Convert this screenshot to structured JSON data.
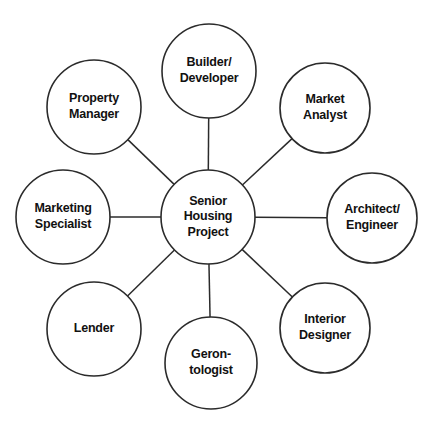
{
  "diagram": {
    "type": "hub-and-spoke",
    "background_color": "#ffffff",
    "stroke_color": "#2b2b2b",
    "text_color": "#111111",
    "hub": {
      "id": "senior-housing-project",
      "label": "Senior Housing Project",
      "lines": [
        "Senior",
        "Housing",
        "Project"
      ],
      "cx": 208,
      "cy": 217,
      "r": 47
    },
    "satellites": [
      {
        "id": "builder-developer",
        "label": "Builder/Developer",
        "lines": [
          "Builder/",
          "Developer"
        ],
        "cx": 209,
        "cy": 71,
        "r": 47
      },
      {
        "id": "market-analyst",
        "label": "Market Analyst",
        "lines": [
          "Market",
          "Analyst"
        ],
        "cx": 325,
        "cy": 108,
        "r": 45
      },
      {
        "id": "architect-engineer",
        "label": "Architect/Engineer",
        "lines": [
          "Architect/",
          "Engineer"
        ],
        "cx": 372,
        "cy": 218,
        "r": 45
      },
      {
        "id": "interior-designer",
        "label": "Interior Designer",
        "lines": [
          "Interior",
          "Designer"
        ],
        "cx": 325,
        "cy": 328,
        "r": 45
      },
      {
        "id": "gerontologist",
        "label": "Gerontologist",
        "lines": [
          "Geron-",
          "tologist"
        ],
        "cx": 211,
        "cy": 363,
        "r": 46
      },
      {
        "id": "lender",
        "label": "Lender",
        "lines": [
          "Lender"
        ],
        "cx": 94,
        "cy": 329,
        "r": 47
      },
      {
        "id": "marketing-specialist",
        "label": "Marketing Specialist",
        "lines": [
          "Marketing",
          "Specialist"
        ],
        "cx": 63,
        "cy": 217,
        "r": 47
      },
      {
        "id": "property-manager",
        "label": "Property Manager",
        "lines": [
          "Property",
          "Manager"
        ],
        "cx": 94,
        "cy": 107,
        "r": 47
      }
    ],
    "connections": [
      {
        "from": "senior-housing-project",
        "to": "builder-developer"
      },
      {
        "from": "senior-housing-project",
        "to": "market-analyst"
      },
      {
        "from": "senior-housing-project",
        "to": "architect-engineer"
      },
      {
        "from": "senior-housing-project",
        "to": "interior-designer"
      },
      {
        "from": "senior-housing-project",
        "to": "gerontologist"
      },
      {
        "from": "senior-housing-project",
        "to": "lender"
      },
      {
        "from": "senior-housing-project",
        "to": "marketing-specialist"
      },
      {
        "from": "senior-housing-project",
        "to": "property-manager"
      }
    ]
  }
}
